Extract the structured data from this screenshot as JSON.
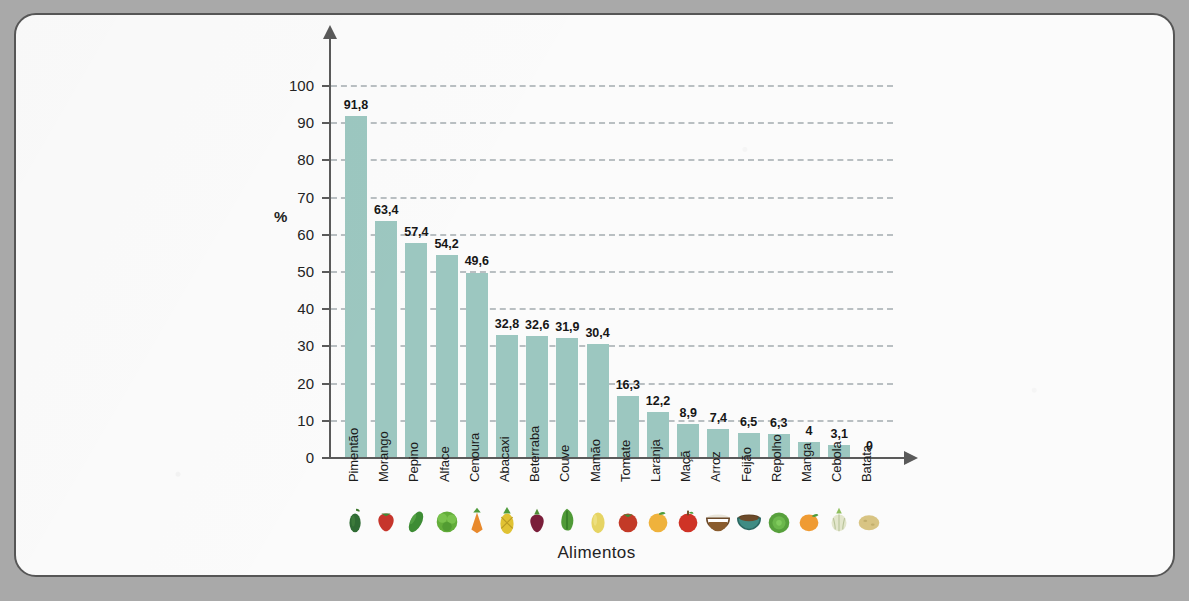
{
  "chart_data": {
    "type": "bar",
    "title": "",
    "xlabel": "Alimentos",
    "ylabel": "%",
    "ylim": [
      0,
      100
    ],
    "ytick_step": 10,
    "yticks": [
      0,
      10,
      20,
      30,
      40,
      50,
      60,
      70,
      80,
      90,
      100
    ],
    "grid": true,
    "legend": false,
    "bar_color": "#9cc7c0",
    "categories": [
      "Pimentão",
      "Morango",
      "Pepino",
      "Alface",
      "Cenoura",
      "Abacaxi",
      "Beterraba",
      "Couve",
      "Mamão",
      "Tomate",
      "Laranja",
      "Maçã",
      "Arroz",
      "Feijão",
      "Repolho",
      "Manga",
      "Cebola",
      "Batata"
    ],
    "values": [
      91.8,
      63.4,
      57.4,
      54.2,
      49.6,
      32.8,
      32.6,
      31.9,
      30.4,
      16.3,
      12.2,
      8.9,
      7.4,
      6.5,
      6.3,
      4,
      3.1,
      0
    ],
    "value_labels": [
      "91,8",
      "63,4",
      "57,4",
      "54,2",
      "49,6",
      "32,8",
      "32,6",
      "31,9",
      "30,4",
      "16,3",
      "12,2",
      "8,9",
      "7,4",
      "6,5",
      "6,3",
      "4",
      "3,1",
      "0"
    ],
    "icons": [
      "pepper-icon",
      "strawberry-icon",
      "cucumber-icon",
      "lettuce-icon",
      "carrot-icon",
      "pineapple-icon",
      "beetroot-icon",
      "kale-icon",
      "papaya-icon",
      "tomato-icon",
      "orange-icon",
      "apple-icon",
      "rice-bowl-icon",
      "beans-bowl-icon",
      "cabbage-icon",
      "mango-icon",
      "onion-icon",
      "potato-icon"
    ],
    "icon_colors": [
      "#2f6b33",
      "#c6352b",
      "#4f9c3c",
      "#63ad3a",
      "#e8892c",
      "#e0c233",
      "#7a1e3a",
      "#4f9a37",
      "#e6d463",
      "#c33a27",
      "#efb23c",
      "#cf3326",
      "#d9d2c2",
      "#6c4a2a",
      "#57a03c",
      "#ef9b33",
      "#e3e6cc",
      "#d8c483"
    ]
  }
}
